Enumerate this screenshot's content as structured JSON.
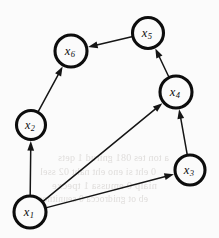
{
  "figure": {
    "background_color": "#fbfbfb",
    "stroke_color": "#0d0d0d",
    "width": 219,
    "height": 238
  },
  "graph_data": {
    "type": "directed-graph",
    "node_radius_default": 15.5,
    "node_stroke_width": 3.1,
    "edge_stroke_width": 1.5,
    "nodes": [
      {
        "id": "x1",
        "label_base": "x",
        "label_sub": "1",
        "cx": 30,
        "cy": 212,
        "r": 16.0,
        "font_size": 12.5
      },
      {
        "id": "x2",
        "label_base": "x",
        "label_sub": "2",
        "cx": 31,
        "cy": 125,
        "r": 14.5,
        "font_size": 12.0
      },
      {
        "id": "x3",
        "label_base": "x",
        "label_sub": "3",
        "cx": 190,
        "cy": 170,
        "r": 15.0,
        "font_size": 12.5
      },
      {
        "id": "x4",
        "label_base": "x",
        "label_sub": "4",
        "cx": 176,
        "cy": 92,
        "r": 16.0,
        "font_size": 12.5
      },
      {
        "id": "x5",
        "label_base": "x",
        "label_sub": "5",
        "cx": 148,
        "cy": 33,
        "r": 15.5,
        "font_size": 12.5
      },
      {
        "id": "x6",
        "label_base": "x",
        "label_sub": "6",
        "cx": 71,
        "cy": 51,
        "r": 16.0,
        "font_size": 12.5
      }
    ],
    "edges": [
      {
        "id": "e-x1-x2",
        "from": "x1",
        "to": "x2",
        "directed": true
      },
      {
        "id": "e-x1-x3",
        "from": "x1",
        "to": "x3",
        "directed": true
      },
      {
        "id": "e-x1-x4",
        "from": "x1",
        "to": "x4",
        "directed": true
      },
      {
        "id": "e-x2-x6",
        "from": "x2",
        "to": "x6",
        "directed": true
      },
      {
        "id": "e-x3-x4",
        "from": "x3",
        "to": "x4",
        "directed": true
      },
      {
        "id": "e-x4-x5",
        "from": "x4",
        "to": "x5",
        "directed": true
      },
      {
        "id": "e-x5-x6",
        "from": "x5",
        "to": "x6",
        "directed": true
      }
    ]
  },
  "background_bleed": {
    "note": "faint mirrored show-through text from reverse side of page",
    "lines": [
      {
        "text": "a ton tes 081 gnirud 1 qets",
        "x": 58,
        "y": 152,
        "size": 10.0
      },
      {
        "text": "0 eht si eno eht naht 02 ssel",
        "x": 40,
        "y": 166,
        "size": 10.0
      },
      {
        "text": "nialp 0 emussa 1 tpecxe",
        "x": 52,
        "y": 180,
        "size": 10.5
      },
      {
        "text": "eb ot gnidrocca 0 seunitnoc",
        "x": 38,
        "y": 194,
        "size": 9.5
      }
    ]
  }
}
